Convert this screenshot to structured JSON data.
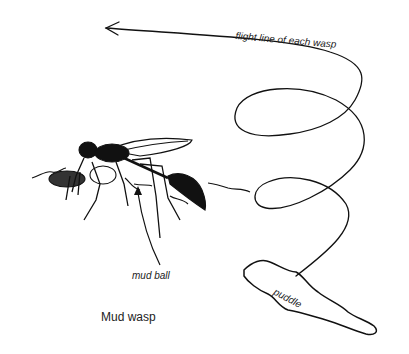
{
  "figure": {
    "caption": "Mud wasp",
    "labels": {
      "flight_line": "flight line of each wasp",
      "mud_ball": "mud ball",
      "puddle": "puddle"
    }
  },
  "colors": {
    "ink": "#111111",
    "background": "#ffffff"
  }
}
